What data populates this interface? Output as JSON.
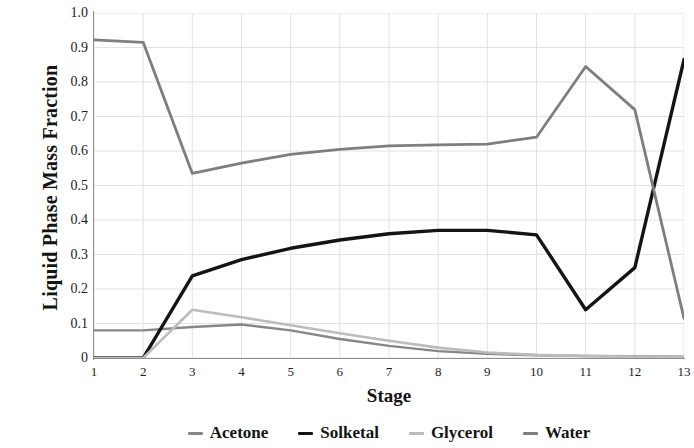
{
  "chart_data": {
    "type": "line",
    "title": "",
    "xlabel": "Stage",
    "ylabel": "Liquid Phase Mass Fraction",
    "x": [
      1,
      2,
      3,
      4,
      5,
      6,
      7,
      8,
      9,
      10,
      11,
      12,
      13
    ],
    "xtick_labels": [
      "1",
      "2",
      "3",
      "4",
      "5",
      "6",
      "7",
      "8",
      "9",
      "10",
      "11",
      "12",
      "13"
    ],
    "ytick_labels": [
      "1.0",
      "0.9",
      "0.8",
      "0.7",
      "0.6",
      "0.5",
      "0.4",
      "0.3",
      "0.2",
      "0.1",
      "0"
    ],
    "ytick_values": [
      1.0,
      0.9,
      0.8,
      0.7,
      0.6,
      0.5,
      0.4,
      0.3,
      0.2,
      0.1,
      0
    ],
    "xlim": [
      1,
      13
    ],
    "ylim": [
      0,
      1.0
    ],
    "grid": true,
    "grid_color": "#e2e2e2",
    "legend_position": "bottom",
    "series": [
      {
        "name": "Acetone",
        "color": "#878787",
        "width": 2.4,
        "values": [
          0.08,
          0.08,
          0.09,
          0.097,
          0.08,
          0.055,
          0.035,
          0.02,
          0.012,
          0.008,
          0.006,
          0.005,
          0.004
        ]
      },
      {
        "name": "Solketal",
        "color": "#141414",
        "width": 3.4,
        "values": [
          0.0,
          0.0,
          0.238,
          0.285,
          0.318,
          0.342,
          0.36,
          0.37,
          0.37,
          0.357,
          0.14,
          0.262,
          0.865
        ]
      },
      {
        "name": "Glycerol",
        "color": "#bcbcbc",
        "width": 2.6,
        "values": [
          0.0,
          0.0,
          0.14,
          0.118,
          0.095,
          0.072,
          0.05,
          0.03,
          0.016,
          0.009,
          0.006,
          0.004,
          0.003
        ]
      },
      {
        "name": "Water",
        "color": "#7e7e7e",
        "width": 2.8,
        "values": [
          0.922,
          0.915,
          0.535,
          0.565,
          0.59,
          0.605,
          0.615,
          0.618,
          0.62,
          0.64,
          0.845,
          0.72,
          0.115
        ]
      }
    ]
  },
  "axis": {
    "y_title": "Liquid Phase Mass Fraction",
    "x_title": "Stage"
  },
  "legend": {
    "items": [
      {
        "label": "Acetone",
        "color": "#878787"
      },
      {
        "label": "Solketal",
        "color": "#141414"
      },
      {
        "label": "Glycerol",
        "color": "#bcbcbc"
      },
      {
        "label": "Water",
        "color": "#7e7e7e"
      }
    ]
  }
}
